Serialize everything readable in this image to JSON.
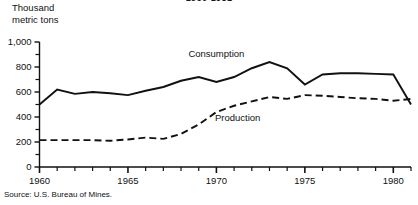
{
  "chart_data": {
    "type": "line",
    "title": "1960-1981",
    "ylabel": "Thousand metric tons",
    "xlabel": "",
    "ylim": [
      0,
      1000
    ],
    "xlim": [
      1960,
      1981
    ],
    "grid": false,
    "legend_position": "inline-annotations",
    "y_ticks_major": [
      "0",
      "200",
      "400",
      "600",
      "800",
      "1,000"
    ],
    "y_tick_values": [
      0,
      200,
      400,
      600,
      800,
      1000
    ],
    "y_minor_tick_values": [
      100,
      300,
      500,
      700,
      900
    ],
    "x_ticks_major": [
      "1960",
      "1965",
      "1970",
      "1975",
      "1980"
    ],
    "x_tick_values": [
      1960,
      1965,
      1970,
      1975,
      1980
    ],
    "x_minor_tick_values": [
      1961,
      1962,
      1963,
      1964,
      1966,
      1967,
      1968,
      1969,
      1971,
      1972,
      1973,
      1974,
      1976,
      1977,
      1978,
      1979,
      1981
    ],
    "x": [
      1960,
      1961,
      1962,
      1963,
      1964,
      1965,
      1966,
      1967,
      1968,
      1969,
      1970,
      1971,
      1972,
      1973,
      1974,
      1975,
      1976,
      1977,
      1978,
      1979,
      1980,
      1981
    ],
    "series": [
      {
        "name": "Consumption",
        "style": "solid",
        "color": "#111111",
        "values": [
          500,
          620,
          585,
          600,
          590,
          575,
          610,
          640,
          690,
          720,
          680,
          720,
          790,
          840,
          790,
          660,
          740,
          750,
          750,
          745,
          740,
          500
        ]
      },
      {
        "name": "Production",
        "style": "dashed",
        "color": "#111111",
        "values": [
          215,
          215,
          215,
          215,
          210,
          220,
          235,
          225,
          265,
          340,
          440,
          490,
          525,
          560,
          545,
          575,
          570,
          560,
          550,
          545,
          530,
          545
        ]
      }
    ],
    "annotations": [
      {
        "text": "Consumption",
        "x": 1970,
        "y": 900
      },
      {
        "text": "Production",
        "x": 1971.5,
        "y": 390
      }
    ],
    "source": "Source: U.S. Bureau of Mines."
  }
}
